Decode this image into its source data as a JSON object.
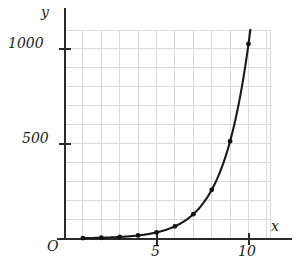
{
  "figure": {
    "axis_labels": {
      "x": "x",
      "y": "y",
      "origin": "O"
    },
    "colors": {
      "curve": "#1a1a1a",
      "axis": "#2b2b2b",
      "grid": "#d9d9e3",
      "point": "#111111",
      "background": "#ffffff"
    }
  },
  "chart_data": {
    "type": "line",
    "title": "",
    "subtitle": "",
    "xlabel": "x",
    "ylabel": "y",
    "xlim": [
      0,
      11.2
    ],
    "ylim": [
      0,
      1110
    ],
    "grid": true,
    "legend": null,
    "x_ticks": [
      5,
      10
    ],
    "x_tick_labels": [
      "5",
      "10"
    ],
    "y_ticks": [
      500,
      1000
    ],
    "y_tick_labels": [
      "500",
      "1000"
    ],
    "x_grid_step": 1,
    "y_grid_step": 100,
    "origin_label": "O",
    "series": [
      {
        "name": "y = 2^x",
        "marker": "circle",
        "x": [
          1,
          2,
          3,
          4,
          5,
          6,
          7,
          8,
          9,
          10
        ],
        "values": [
          2,
          4,
          8,
          16,
          32,
          64,
          128,
          256,
          512,
          1024
        ]
      }
    ],
    "curve_extends_beyond_last_point": true,
    "annotations": []
  }
}
